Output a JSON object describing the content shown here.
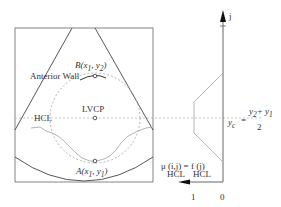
{
  "diagram": {
    "labels": {
      "anterior_wall": "Anterior Wall",
      "point_b": "B(x",
      "point_b_sub1": "1",
      "point_b_mid": ", y",
      "point_b_sub2": "2",
      "point_b_close": ")",
      "point_a": "A(x",
      "point_a_sub1": "1",
      "point_a_mid": ", y",
      "point_a_sub2": "1",
      "point_a_close": ")",
      "hcl_left": "HCL",
      "lvcp": "LVCP",
      "axis_j": "j",
      "yc_lhs": "y",
      "yc_lhs_sub": "c",
      "yc_eq": "=",
      "yc_num": "y",
      "yc_num_sub2": "2",
      "yc_num_plus": "+ y",
      "yc_num_sub1": "1",
      "yc_den": "2",
      "mu_func": "μ (i,j) = f (j)",
      "mu_sub": "HCL",
      "f_sub": "HCL",
      "tick_1": "1",
      "tick_0": "0"
    },
    "colors": {
      "stroke": "#333333",
      "light_stroke": "#999999",
      "dashed": "#aaaaaa"
    }
  }
}
